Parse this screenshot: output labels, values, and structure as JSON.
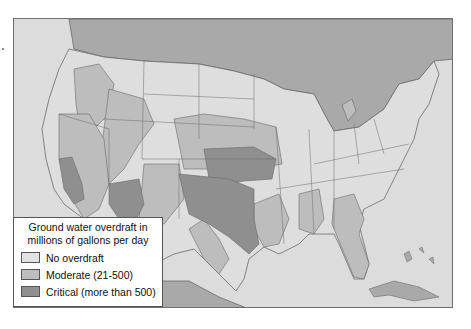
{
  "map": {
    "title": "Ground water overdraft in millions of gallons per day",
    "colors": {
      "ocean": "#dcdcdc",
      "canada_mexico": "#a9a9a9",
      "no_overdraft": "#dedede",
      "moderate": "#bdbdbd",
      "critical": "#8f8f8f",
      "border": "#6a6a6a"
    }
  },
  "legend": {
    "title_line1": "Ground water overdraft in",
    "title_line2": "millions of gallons per day",
    "items": [
      {
        "label": "No overdraft",
        "color": "#e2e2e2"
      },
      {
        "label": "Moderate (21-500)",
        "color": "#bdbdbd"
      },
      {
        "label": "Critical (more than 500)",
        "color": "#8f8f8f"
      }
    ]
  }
}
